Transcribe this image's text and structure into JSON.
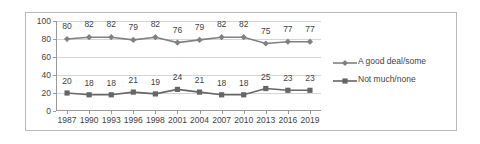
{
  "chart_data": {
    "type": "line",
    "title": "",
    "subtitle": "",
    "xlabel": "",
    "ylabel": "",
    "ylim": [
      0,
      100
    ],
    "yticks": [
      0,
      20,
      40,
      60,
      80,
      100
    ],
    "grid": true,
    "legend_position": "right",
    "categories": [
      "1987",
      "1990",
      "1993",
      "1996",
      "1998",
      "2001",
      "2004",
      "2007",
      "2010",
      "2013",
      "2016",
      "2019"
    ],
    "series": [
      {
        "name": "A good deal/some",
        "marker": "diamond",
        "color": "#808080",
        "values": [
          80,
          82,
          82,
          79,
          82,
          76,
          79,
          82,
          82,
          75,
          77,
          77
        ]
      },
      {
        "name": "Not much/none",
        "marker": "square",
        "color": "#666666",
        "values": [
          20,
          18,
          18,
          21,
          19,
          24,
          21,
          18,
          18,
          25,
          23,
          23
        ]
      }
    ]
  },
  "legend": {
    "items": [
      {
        "label": "A good deal/some"
      },
      {
        "label": "Not much/none"
      }
    ]
  },
  "colors": {
    "series_1": "#808080",
    "series_2": "#666666",
    "grid": "#d4d4d4",
    "axis": "#9a9a9a",
    "text": "#3f3f3f",
    "frame": "#b9b9b9",
    "background": "#ffffff"
  }
}
